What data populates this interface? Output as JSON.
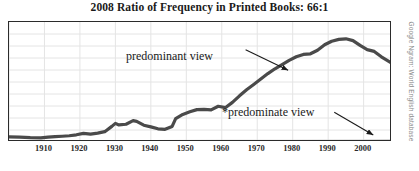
{
  "chart_data": {
    "type": "line",
    "title": "2008 Ratio of Frequency in Printed Books: 66:1",
    "xlabel": "",
    "ylabel": "",
    "source_credit": "Google Ngram: World English database",
    "xlim": [
      1900,
      2008
    ],
    "ylim": [
      0,
      10
    ],
    "grid": true,
    "grid_x_step": 10,
    "grid_y_lines": 9,
    "legend_position": "none",
    "xticks": [
      1910,
      1920,
      1930,
      1940,
      1950,
      1960,
      1970,
      1980,
      1990,
      2000
    ],
    "xtick_labels": [
      "1910",
      "1920",
      "1930",
      "1940",
      "1950",
      "1960",
      "1970",
      "1980",
      "1990",
      "2000"
    ],
    "yticks": [],
    "ytick_labels": [],
    "series": [
      {
        "name": "predominant view",
        "color": "#4a4a4a",
        "width": 3.2,
        "x": [
          1900,
          1903,
          1906,
          1909,
          1911,
          1913,
          1915,
          1917,
          1919,
          1921,
          1923,
          1925,
          1927,
          1929,
          1930,
          1931,
          1933,
          1935,
          1936,
          1938,
          1940,
          1942,
          1944,
          1946,
          1947,
          1949,
          1951,
          1953,
          1955,
          1957,
          1959,
          1961,
          1963,
          1965,
          1967,
          1969,
          1971,
          1973,
          1975,
          1977,
          1979,
          1981,
          1983,
          1985,
          1987,
          1989,
          1991,
          1993,
          1995,
          1997,
          1999,
          2001,
          2003,
          2005,
          2008
        ],
        "y": [
          0.42,
          0.4,
          0.36,
          0.34,
          0.4,
          0.44,
          0.48,
          0.52,
          0.6,
          0.72,
          0.66,
          0.74,
          0.86,
          1.3,
          1.55,
          1.42,
          1.48,
          1.78,
          1.72,
          1.4,
          1.26,
          1.1,
          1.06,
          1.3,
          1.95,
          2.3,
          2.52,
          2.7,
          2.72,
          2.68,
          2.98,
          2.86,
          3.3,
          3.85,
          4.35,
          4.8,
          5.25,
          5.7,
          6.1,
          6.45,
          6.8,
          7.1,
          7.3,
          7.35,
          7.65,
          8.1,
          8.4,
          8.55,
          8.6,
          8.45,
          8.05,
          7.7,
          7.55,
          7.1,
          6.55
        ]
      },
      {
        "name": "*predominate view",
        "color": "#c9c9c9",
        "width": 2.2,
        "x": [
          1900,
          1920,
          1940,
          1960,
          1980,
          2000,
          2008
        ],
        "y": [
          0.06,
          0.07,
          0.08,
          0.09,
          0.1,
          0.12,
          0.13
        ]
      }
    ],
    "annotations": [
      {
        "id": "predominant-label",
        "text": "predominant view",
        "arrow_from": [
          1967,
          7.6
        ],
        "arrow_to": [
          1979,
          5.9
        ]
      },
      {
        "id": "predominate-label",
        "text": "*predominate view",
        "arrow_from": [
          1992,
          2.4
        ],
        "arrow_to": [
          2003,
          0.5
        ]
      }
    ]
  },
  "colors": {
    "frame": "#2b2b2b",
    "grid": "#e4e4e4",
    "background": "#ffffff",
    "primary_series": "#4a4a4a",
    "secondary_series": "#c9c9c9",
    "text": "#1a1a1a",
    "credit": "#8a8a8a"
  }
}
